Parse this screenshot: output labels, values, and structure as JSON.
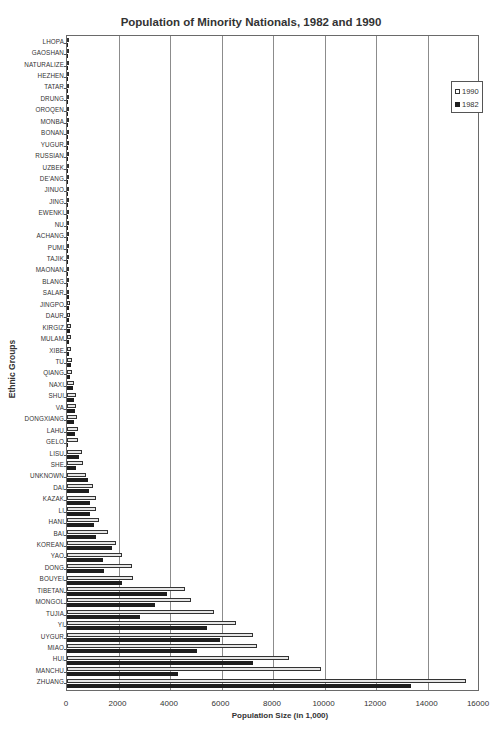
{
  "chart_data": {
    "type": "bar",
    "orientation": "horizontal",
    "title": "Population of Minority Nationals, 1982 and 1990",
    "xlabel": "Population Size (in 1,000)",
    "ylabel": "Ethnic Groups",
    "xlim": [
      0,
      16000
    ],
    "xticks": [
      "0",
      "2000",
      "4000",
      "6000",
      "8000",
      "10000",
      "12000",
      "14000",
      "16000"
    ],
    "grid": "vertical",
    "legend_position": "top-right inside",
    "legend": [
      "1990",
      "1982"
    ],
    "colors": {
      "1990": "#e6e6e6",
      "1982": "#1e1e1e"
    },
    "categories": [
      "LHOPA",
      "GAOSHAN",
      "NATURALIZE",
      "HEZHEN",
      "TATAR",
      "DRUNG",
      "OROQEN",
      "MONBA",
      "BONAN",
      "YUGUR",
      "RUSSIAN",
      "UZBEK",
      "DE'ANG",
      "JINUO",
      "JING",
      "EWENKI",
      "NU",
      "ACHANG",
      "PUMI",
      "TAJIK",
      "MAONAN",
      "BLANG",
      "SALAR",
      "JINGPO",
      "DAUR",
      "KIRGIZ",
      "MULAM",
      "XIBE",
      "TU",
      "QIANG",
      "NAXI",
      "SHUI",
      "VA",
      "DONGXIANG",
      "LAHU",
      "GELO",
      "LISU",
      "SHE",
      "UNKNOWN",
      "DAI",
      "KAZAK",
      "LI",
      "HANI",
      "BAI",
      "KOREAN",
      "YAO",
      "DONG",
      "BOUYEI",
      "TIBETAN",
      "MONGOL",
      "TUJIA",
      "YI",
      "UYGUR",
      "MIAO",
      "HUI",
      "MANCHU",
      "ZHUANG"
    ],
    "series": [
      {
        "name": "1990",
        "values": [
          2,
          3,
          3,
          4,
          5,
          6,
          7,
          7,
          12,
          12,
          13,
          15,
          15,
          18,
          19,
          26,
          27,
          28,
          30,
          33,
          72,
          82,
          88,
          119,
          121,
          144,
          160,
          173,
          192,
          198,
          278,
          347,
          352,
          374,
          412,
          438,
          575,
          630,
          752,
          1025,
          1112,
          1110,
          1254,
          1595,
          1921,
          2137,
          2509,
          2548,
          4593,
          4807,
          5726,
          6579,
          7208,
          7398,
          8612,
          9847,
          15490
        ]
      },
      {
        "name": "1982",
        "values": [
          1,
          2,
          2,
          1,
          4,
          5,
          4,
          6,
          9,
          11,
          3,
          12,
          12,
          11,
          13,
          19,
          23,
          20,
          24,
          27,
          38,
          58,
          69,
          93,
          94,
          114,
          90,
          84,
          159,
          102,
          245,
          287,
          298,
          280,
          304,
          54,
          481,
          368,
          799,
          839,
          908,
          887,
          1059,
          1131,
          1765,
          1403,
          1426,
          2120,
          3870,
          3411,
          2836,
          5453,
          5957,
          5030,
          7219,
          4299,
          13378
        ]
      }
    ]
  },
  "legend_labels": [
    "1990",
    "1982"
  ]
}
